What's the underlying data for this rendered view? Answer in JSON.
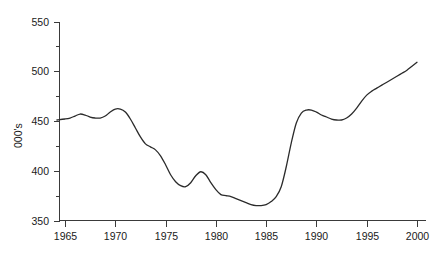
{
  "chart_data": {
    "type": "line",
    "title": "",
    "subtitle": "",
    "xlabel": "",
    "ylabel": "000's",
    "xlim": [
      1964.2,
      2000.4
    ],
    "ylim": [
      350,
      550
    ],
    "grid": false,
    "legend": null,
    "x_ticks": [
      1965,
      1970,
      1975,
      1980,
      1985,
      1990,
      1995,
      2000
    ],
    "x_tick_labels": [
      "1965",
      "1970",
      "1975",
      "1980",
      "1985",
      "1990",
      "1995",
      "2000"
    ],
    "y_ticks": [
      350,
      400,
      450,
      500,
      550
    ],
    "y_tick_labels": [
      "350",
      "400",
      "450",
      "500",
      "550"
    ],
    "y_minor_ticks": [
      375,
      425,
      475,
      525
    ],
    "series": [
      {
        "name": "",
        "color": "#2b2b2b",
        "x": [
          1964.2,
          1965,
          1965.5,
          1966,
          1966.5,
          1967,
          1967.5,
          1968,
          1968.5,
          1969,
          1969.5,
          1970,
          1970.5,
          1971,
          1971.5,
          1972,
          1972.5,
          1973,
          1973.5,
          1974,
          1974.5,
          1975,
          1975.5,
          1976,
          1976.5,
          1977,
          1977.5,
          1978,
          1978.5,
          1979,
          1979.5,
          1980,
          1980.5,
          1981,
          1981.5,
          1982,
          1982.5,
          1983,
          1983.5,
          1984,
          1984.5,
          1985,
          1985.5,
          1986,
          1986.5,
          1987,
          1987.5,
          1988,
          1988.5,
          1989,
          1989.5,
          1990,
          1990.5,
          1991,
          1991.5,
          1992,
          1992.5,
          1993,
          1993.5,
          1994,
          1994.5,
          1995,
          1995.5,
          1996,
          1996.5,
          1997,
          1997.5,
          1998,
          1998.5,
          1999,
          1999.5,
          2000
        ],
        "y": [
          451,
          452,
          453,
          455,
          457,
          456,
          454,
          453,
          453,
          455,
          459,
          462,
          462,
          459,
          452,
          443,
          434,
          427,
          424,
          421,
          415,
          406,
          396,
          389,
          385,
          384,
          388,
          395,
          399,
          396,
          388,
          381,
          376,
          375,
          374,
          372,
          370,
          368,
          366,
          365,
          365,
          366,
          369,
          374,
          384,
          404,
          428,
          448,
          458,
          461,
          461,
          459,
          456,
          454,
          452,
          451,
          451,
          453,
          457,
          463,
          470,
          476,
          480,
          483,
          486,
          489,
          492,
          495,
          498,
          501,
          505,
          509
        ]
      }
    ]
  },
  "axis": {
    "y_title": "000's"
  }
}
